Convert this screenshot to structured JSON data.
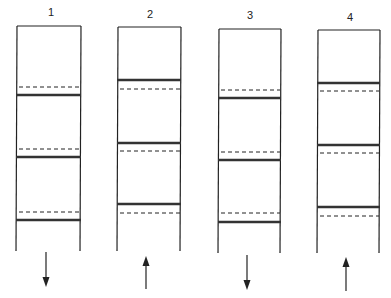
{
  "diagram": {
    "type": "film-strip-frame-sequence",
    "stroke_color": "#222222",
    "bar_color": "#333333",
    "strips": [
      {
        "label": "1",
        "left": 17,
        "right": 81,
        "top": 26,
        "bottom": 251,
        "label_x": 51,
        "label_y": 16,
        "has_top_edge": true,
        "solid_lines": [
          95,
          157,
          220
        ],
        "dashed_lines": [
          87,
          149,
          212
        ],
        "arrow": {
          "direction": "down",
          "x": 46,
          "y1": 252,
          "y2": 287
        }
      },
      {
        "label": "2",
        "left": 118,
        "right": 181,
        "top": 27,
        "bottom": 251,
        "label_x": 150,
        "label_y": 18,
        "has_top_edge": true,
        "solid_lines": [
          80,
          143,
          204
        ],
        "dashed_lines": [
          89,
          151,
          213
        ],
        "arrow": {
          "direction": "up",
          "x": 146,
          "y1": 256,
          "y2": 289
        }
      },
      {
        "label": "3",
        "left": 219,
        "right": 281,
        "top": 29,
        "bottom": 253,
        "label_x": 250,
        "label_y": 19,
        "has_top_edge": true,
        "solid_lines": [
          98,
          160,
          222
        ],
        "dashed_lines": [
          90,
          152,
          213
        ],
        "arrow": {
          "direction": "down",
          "x": 247,
          "y1": 255,
          "y2": 290
        }
      },
      {
        "label": "4",
        "left": 318,
        "right": 380,
        "top": 30,
        "bottom": 253,
        "label_x": 350,
        "label_y": 21,
        "has_top_edge": true,
        "solid_lines": [
          83,
          145,
          207
        ],
        "dashed_lines": [
          91,
          153,
          216
        ],
        "arrow": {
          "direction": "up",
          "x": 346,
          "y1": 257,
          "y2": 291
        }
      }
    ]
  }
}
